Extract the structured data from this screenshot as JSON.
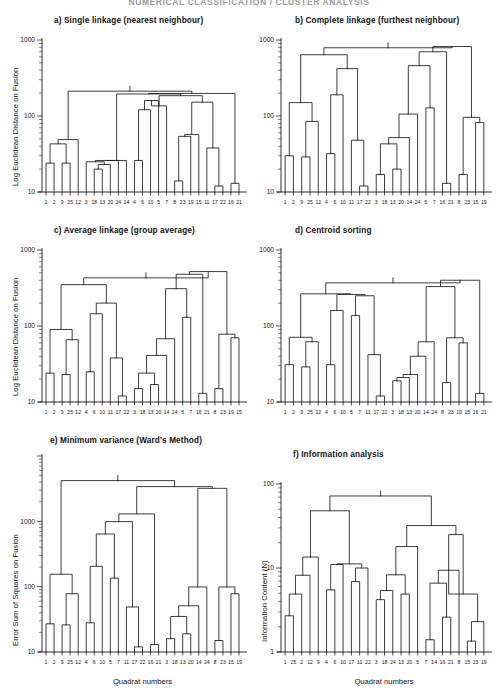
{
  "running_head": "NUMERICAL CLASSIFICATION / CLUSTER ANALYSIS",
  "axis_titles": {
    "log_euclidean": "Log Euclidean Distance on Fusion",
    "error_sum_squares": "Error Sum of Squares on Fusion",
    "information_content": "Information Content (N)",
    "quadrat_numbers": "Quadrat numbers"
  },
  "chart_data": [
    {
      "id": "panel-a",
      "type": "dendrogram",
      "title": "a) Single linkage (nearest neighbour)",
      "ylabel": "Log Euclidean Distance on Fusion",
      "xlabel": "",
      "yscale": "log",
      "ylim": [
        10,
        1000
      ],
      "yticks": [
        10,
        100,
        1000
      ],
      "ytick_labels": [
        "10",
        "100",
        "1000"
      ],
      "leaves": [
        1,
        2,
        9,
        25,
        12,
        3,
        18,
        13,
        20,
        24,
        14,
        4,
        6,
        10,
        5,
        7,
        8,
        23,
        19,
        15,
        11,
        17,
        22,
        16,
        21
      ],
      "merges": [
        {
          "left": 0,
          "right": 1,
          "height": 24
        },
        {
          "left": 2,
          "right": 3,
          "height": 24
        },
        {
          "left": -1,
          "right": -2,
          "height": 43
        },
        {
          "left": -3,
          "right": 4,
          "height": 49
        },
        {
          "left": 6,
          "right": 7,
          "height": 20
        },
        {
          "left": -5,
          "right": 8,
          "height": 23
        },
        {
          "left": 5,
          "right": -6,
          "height": 25
        },
        {
          "left": -7,
          "right": 9,
          "height": 26
        },
        {
          "left": -8,
          "right": 10,
          "height": 26
        },
        {
          "left": 11,
          "right": 12,
          "height": 26
        },
        {
          "left": -10,
          "right": 13,
          "height": 121
        },
        {
          "left": -11,
          "right": 14,
          "height": 160
        },
        {
          "left": -12,
          "right": 15,
          "height": 136
        },
        {
          "left": 16,
          "right": 17,
          "height": 14
        },
        {
          "left": -14,
          "right": 18,
          "height": 54
        },
        {
          "left": -15,
          "right": 19,
          "height": 57
        },
        {
          "left": 21,
          "right": 22,
          "height": 12
        },
        {
          "left": 20,
          "right": -17,
          "height": 38
        },
        {
          "left": 23,
          "right": 24,
          "height": 13
        },
        {
          "left": -16,
          "right": -18,
          "height": 152
        },
        {
          "left": -13,
          "right": -20,
          "height": 185
        },
        {
          "left": -9,
          "right": -21,
          "height": 195
        },
        {
          "left": -22,
          "right": -19,
          "height": 198
        },
        {
          "left": -4,
          "right": -23,
          "height": 212
        }
      ]
    },
    {
      "id": "panel-b",
      "type": "dendrogram",
      "title": "b) Complete linkage (furthest neighbour)",
      "ylabel": "",
      "xlabel": "",
      "yscale": "log",
      "ylim": [
        10,
        1000
      ],
      "yticks": [
        10,
        100,
        1000
      ],
      "ytick_labels": [
        "10",
        "100",
        "1000"
      ],
      "leaves": [
        1,
        2,
        9,
        25,
        12,
        4,
        6,
        10,
        11,
        17,
        22,
        3,
        18,
        13,
        20,
        14,
        24,
        5,
        7,
        16,
        21,
        8,
        23,
        15,
        19
      ],
      "merges": [
        {
          "left": 0,
          "right": 1,
          "height": 30
        },
        {
          "left": 2,
          "right": 3,
          "height": 29
        },
        {
          "left": -2,
          "right": 4,
          "height": 85
        },
        {
          "left": -1,
          "right": -3,
          "height": 150
        },
        {
          "left": 5,
          "right": 6,
          "height": 32
        },
        {
          "left": -5,
          "right": 7,
          "height": 190
        },
        {
          "left": 9,
          "right": 10,
          "height": 12
        },
        {
          "left": 8,
          "right": -7,
          "height": 48
        },
        {
          "left": -6,
          "right": -8,
          "height": 420
        },
        {
          "left": -4,
          "right": -9,
          "height": 640
        },
        {
          "left": 11,
          "right": 12,
          "height": 17
        },
        {
          "left": 13,
          "right": 14,
          "height": 20
        },
        {
          "left": -11,
          "right": -12,
          "height": 43
        },
        {
          "left": -13,
          "right": 15,
          "height": 52
        },
        {
          "left": -14,
          "right": 16,
          "height": 106
        },
        {
          "left": 17,
          "right": 18,
          "height": 128
        },
        {
          "left": -15,
          "right": -16,
          "height": 460
        },
        {
          "left": 19,
          "right": 20,
          "height": 13
        },
        {
          "left": -17,
          "right": -18,
          "height": 700
        },
        {
          "left": 21,
          "right": 22,
          "height": 17
        },
        {
          "left": 23,
          "right": 24,
          "height": 82
        },
        {
          "left": -20,
          "right": -21,
          "height": 96
        },
        {
          "left": -19,
          "right": -22,
          "height": 820
        },
        {
          "left": -10,
          "right": -23,
          "height": 790
        }
      ]
    },
    {
      "id": "panel-c",
      "type": "dendrogram",
      "title": "c) Average linkage (group average)",
      "ylabel": "Log Euclidean Distance on Fusion",
      "xlabel": "",
      "yscale": "log",
      "ylim": [
        10,
        1000
      ],
      "yticks": [
        10,
        100,
        1000
      ],
      "ytick_labels": [
        "10",
        "100",
        "1000"
      ],
      "leaves": [
        1,
        2,
        9,
        25,
        12,
        4,
        6,
        10,
        11,
        17,
        22,
        3,
        18,
        13,
        20,
        14,
        24,
        5,
        7,
        16,
        21,
        8,
        23,
        19,
        15
      ],
      "merges": [
        {
          "left": 0,
          "right": 1,
          "height": 24
        },
        {
          "left": 2,
          "right": 3,
          "height": 23
        },
        {
          "left": -2,
          "right": 4,
          "height": 66
        },
        {
          "left": -1,
          "right": -3,
          "height": 90
        },
        {
          "left": 5,
          "right": 6,
          "height": 25
        },
        {
          "left": -5,
          "right": 7,
          "height": 145
        },
        {
          "left": 9,
          "right": 10,
          "height": 12
        },
        {
          "left": 8,
          "right": -7,
          "height": 38
        },
        {
          "left": -6,
          "right": -8,
          "height": 200
        },
        {
          "left": -4,
          "right": -9,
          "height": 350
        },
        {
          "left": 11,
          "right": 12,
          "height": 15
        },
        {
          "left": 13,
          "right": 14,
          "height": 17
        },
        {
          "left": -11,
          "right": -12,
          "height": 24
        },
        {
          "left": -13,
          "right": 15,
          "height": 41
        },
        {
          "left": -14,
          "right": 16,
          "height": 68
        },
        {
          "left": 17,
          "right": 18,
          "height": 130
        },
        {
          "left": -15,
          "right": -16,
          "height": 310
        },
        {
          "left": 19,
          "right": 20,
          "height": 13
        },
        {
          "left": -17,
          "right": -18,
          "height": 480
        },
        {
          "left": 21,
          "right": 22,
          "height": 15
        },
        {
          "left": 23,
          "right": 24,
          "height": 70
        },
        {
          "left": -20,
          "right": -21,
          "height": 78
        },
        {
          "left": -19,
          "right": -22,
          "height": 520
        },
        {
          "left": -10,
          "right": -23,
          "height": 430
        }
      ]
    },
    {
      "id": "panel-d",
      "type": "dendrogram",
      "title": "d) Centroid sorting",
      "ylabel": "",
      "xlabel": "",
      "yscale": "log",
      "ylim": [
        10,
        1000
      ],
      "yticks": [
        10,
        100,
        1000
      ],
      "ytick_labels": [
        "10",
        "100",
        "1000"
      ],
      "leaves": [
        1,
        2,
        9,
        25,
        12,
        4,
        6,
        10,
        5,
        7,
        11,
        17,
        22,
        3,
        18,
        13,
        20,
        14,
        24,
        8,
        23,
        19,
        15,
        16,
        21
      ],
      "merges": [
        {
          "left": 0,
          "right": 1,
          "height": 31
        },
        {
          "left": 2,
          "right": 3,
          "height": 29
        },
        {
          "left": -2,
          "right": 4,
          "height": 62
        },
        {
          "left": -1,
          "right": -3,
          "height": 71
        },
        {
          "left": 5,
          "right": 6,
          "height": 31
        },
        {
          "left": -5,
          "right": 7,
          "height": 160
        },
        {
          "left": 8,
          "right": 9,
          "height": 137
        },
        {
          "left": 11,
          "right": 12,
          "height": 12
        },
        {
          "left": 10,
          "right": -8,
          "height": 42
        },
        {
          "left": -7,
          "right": -9,
          "height": 250
        },
        {
          "left": -6,
          "right": -10,
          "height": 260
        },
        {
          "left": -4,
          "right": -11,
          "height": 265
        },
        {
          "left": 13,
          "right": 14,
          "height": 19
        },
        {
          "left": -13,
          "right": 15,
          "height": 21
        },
        {
          "left": -14,
          "right": 16,
          "height": 23
        },
        {
          "left": -15,
          "right": 17,
          "height": 40
        },
        {
          "left": -16,
          "right": 18,
          "height": 62
        },
        {
          "left": 19,
          "right": 20,
          "height": 18
        },
        {
          "left": 21,
          "right": 22,
          "height": 60
        },
        {
          "left": -18,
          "right": -19,
          "height": 70
        },
        {
          "left": -17,
          "right": -20,
          "height": 330
        },
        {
          "left": 23,
          "right": 24,
          "height": 13
        },
        {
          "left": -21,
          "right": -22,
          "height": 400
        },
        {
          "left": -12,
          "right": -23,
          "height": 370
        }
      ]
    },
    {
      "id": "panel-e",
      "type": "dendrogram",
      "title": "e) Minimum variance (Ward's Method)",
      "ylabel": "Error Sum of Squares on Fusion",
      "xlabel": "Quadrat numbers",
      "yscale": "log",
      "ylim": [
        10,
        10000
      ],
      "yticks": [
        10,
        100,
        1000
      ],
      "ytick_labels": [
        "10",
        "100",
        "1000"
      ],
      "leaves": [
        1,
        2,
        9,
        25,
        12,
        4,
        6,
        10,
        5,
        7,
        11,
        17,
        22,
        16,
        21,
        3,
        18,
        13,
        20,
        14,
        24,
        8,
        23,
        15,
        19
      ],
      "merges": [
        {
          "left": 0,
          "right": 1,
          "height": 27
        },
        {
          "left": 2,
          "right": 3,
          "height": 26
        },
        {
          "left": -2,
          "right": 4,
          "height": 78
        },
        {
          "left": -1,
          "right": -3,
          "height": 155
        },
        {
          "left": 5,
          "right": 6,
          "height": 28
        },
        {
          "left": -5,
          "right": 7,
          "height": 205
        },
        {
          "left": 8,
          "right": 9,
          "height": 135
        },
        {
          "left": -6,
          "right": -7,
          "height": 640
        },
        {
          "left": 11,
          "right": 12,
          "height": 12
        },
        {
          "left": 10,
          "right": -9,
          "height": 49
        },
        {
          "left": -8,
          "right": -10,
          "height": 990
        },
        {
          "left": 13,
          "right": 14,
          "height": 13
        },
        {
          "left": -11,
          "right": -12,
          "height": 1300
        },
        {
          "left": 15,
          "right": 16,
          "height": 16
        },
        {
          "left": 17,
          "right": 18,
          "height": 19
        },
        {
          "left": -14,
          "right": -15,
          "height": 35
        },
        {
          "left": -16,
          "right": 19,
          "height": 51
        },
        {
          "left": -17,
          "right": 20,
          "height": 99
        },
        {
          "left": 21,
          "right": 22,
          "height": 15
        },
        {
          "left": 23,
          "right": 24,
          "height": 78
        },
        {
          "left": -19,
          "right": -20,
          "height": 99
        },
        {
          "left": -18,
          "right": -21,
          "height": 3200
        },
        {
          "left": -13,
          "right": -22,
          "height": 3400
        },
        {
          "left": -4,
          "right": -23,
          "height": 4200
        }
      ]
    },
    {
      "id": "panel-f",
      "type": "dendrogram",
      "title": "f) Information analysis",
      "ylabel": "Information Content (N)",
      "xlabel": "Quadrat numbers",
      "yscale": "log",
      "ylim": [
        1,
        100
      ],
      "yticks": [
        1,
        10,
        100
      ],
      "ytick_labels": [
        "1",
        "10",
        "100"
      ],
      "leaves": [
        1,
        25,
        2,
        12,
        9,
        4,
        6,
        10,
        17,
        11,
        22,
        3,
        18,
        24,
        13,
        20,
        5,
        7,
        14,
        16,
        21,
        8,
        15,
        23,
        19
      ],
      "merges": [
        {
          "left": 0,
          "right": 1,
          "height": 2.7
        },
        {
          "left": -1,
          "right": 2,
          "height": 4.9
        },
        {
          "left": -2,
          "right": 3,
          "height": 8.2
        },
        {
          "left": -3,
          "right": 4,
          "height": 13.5
        },
        {
          "left": 5,
          "right": 6,
          "height": 5.5
        },
        {
          "left": -5,
          "right": 7,
          "height": 11.0
        },
        {
          "left": 8,
          "right": 9,
          "height": 6.9
        },
        {
          "left": -7,
          "right": 10,
          "height": 10.0
        },
        {
          "left": -6,
          "right": -8,
          "height": 11.2
        },
        {
          "left": -4,
          "right": -9,
          "height": 48
        },
        {
          "left": 11,
          "right": 12,
          "height": 4.2
        },
        {
          "left": -11,
          "right": 13,
          "height": 5.4
        },
        {
          "left": 14,
          "right": 15,
          "height": 4.9
        },
        {
          "left": -12,
          "right": -13,
          "height": 8.3
        },
        {
          "left": -14,
          "right": 16,
          "height": 18
        },
        {
          "left": 17,
          "right": 18,
          "height": 1.4
        },
        {
          "left": 19,
          "right": 20,
          "height": 2.6
        },
        {
          "left": -16,
          "right": -17,
          "height": 6.6
        },
        {
          "left": -18,
          "right": 21,
          "height": 9.4
        },
        {
          "left": 22,
          "right": 23,
          "height": 1.35
        },
        {
          "left": -20,
          "right": 24,
          "height": 2.3
        },
        {
          "left": -21,
          "right": -19,
          "height": 4.9
        },
        {
          "left": -19,
          "right": -22,
          "height": 25
        },
        {
          "left": -15,
          "right": -23,
          "height": 32
        },
        {
          "left": -10,
          "right": -24,
          "height": 72
        }
      ]
    }
  ]
}
